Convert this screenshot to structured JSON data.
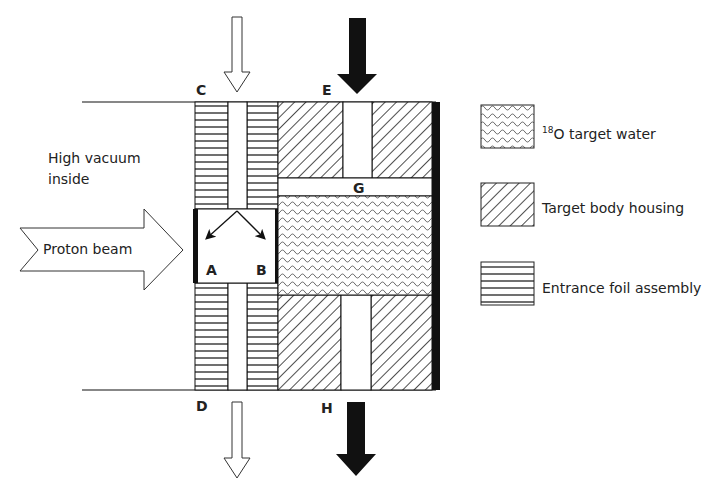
{
  "labels": {
    "vacuum_line1": "High vacuum",
    "vacuum_line2": "inside",
    "proton_beam": "Proton beam",
    "C": "C",
    "D": "D",
    "E": "E",
    "G": "G",
    "H": "H",
    "A": "A",
    "B": "B"
  },
  "legend": [
    {
      "pattern": "wavy",
      "sup": "18",
      "label": "O target water"
    },
    {
      "pattern": "diagonal",
      "label": "Target body housing"
    },
    {
      "pattern": "horizontal",
      "label": "Entrance foil assembly"
    }
  ],
  "colors": {
    "line": "#111111",
    "wave": "#555555",
    "background": "#ffffff"
  }
}
